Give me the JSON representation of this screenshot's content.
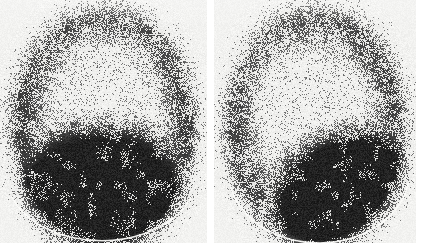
{
  "figure": {
    "caption": "",
    "type": "nuclear-medicine-scintigram",
    "background_color": "#ffffff",
    "panel_background_color": "#f2f2f0",
    "speckle_color": "#0a0a0a",
    "highlight_arc_color": "#fdfdfb",
    "width": 429,
    "height": 243,
    "gap_color": "#ffffff"
  },
  "panels": [
    {
      "id": "left",
      "label": "",
      "x": 0,
      "y": 0,
      "width": 207,
      "height": 243,
      "dome": {
        "center_x": 0.5,
        "center_y": 0.52,
        "radius_x": 0.46,
        "radius_y": 0.5,
        "rotation_deg": 0
      },
      "hot_region": {
        "shape": "horizontal-band",
        "center_x": 0.48,
        "center_y": 0.8,
        "radius_x": 0.46,
        "radius_y": 0.3,
        "rotation_deg": -2,
        "intensity": 1.0
      },
      "rim": {
        "intensity": 0.62,
        "thickness": 0.2
      },
      "cold_center": {
        "center_x": 0.5,
        "center_y": 0.3,
        "radius_x": 0.3,
        "radius_y": 0.2
      },
      "base_arc": {
        "center_x": 0.49,
        "center_y": 0.73,
        "radius_x": 0.455,
        "radius_y": 0.26,
        "start_deg": 18,
        "end_deg": 162
      }
    },
    {
      "id": "right",
      "label": "",
      "x": 214,
      "y": 0,
      "width": 202,
      "height": 243,
      "dome": {
        "center_x": 0.5,
        "center_y": 0.52,
        "radius_x": 0.46,
        "radius_y": 0.5,
        "rotation_deg": 0
      },
      "hot_region": {
        "shape": "diagonal-lobe",
        "center_x": 0.64,
        "center_y": 0.79,
        "radius_x": 0.4,
        "radius_y": 0.26,
        "rotation_deg": -18,
        "intensity": 1.0
      },
      "rim": {
        "intensity": 0.58,
        "thickness": 0.2
      },
      "cold_center": {
        "center_x": 0.43,
        "center_y": 0.33,
        "radius_x": 0.3,
        "radius_y": 0.22
      },
      "base_arc": {
        "center_x": 0.52,
        "center_y": 0.7,
        "radius_x": 0.45,
        "radius_y": 0.3,
        "start_deg": 10,
        "end_deg": 168
      }
    }
  ],
  "chart_data": {
    "type": "heatmap",
    "title": "",
    "xlabel": "",
    "ylabel": "",
    "series": [
      {
        "name": "left panel relative counts",
        "categories": [
          "top rim",
          "upper centre",
          "mid band",
          "lower band",
          "base arc"
        ],
        "values": [
          55,
          18,
          70,
          98,
          8
        ]
      },
      {
        "name": "right panel relative counts",
        "categories": [
          "top rim",
          "upper centre",
          "mid band",
          "lower band",
          "base arc"
        ],
        "values": [
          60,
          15,
          62,
          96,
          8
        ]
      }
    ],
    "legend_position": "none",
    "grid": false
  }
}
